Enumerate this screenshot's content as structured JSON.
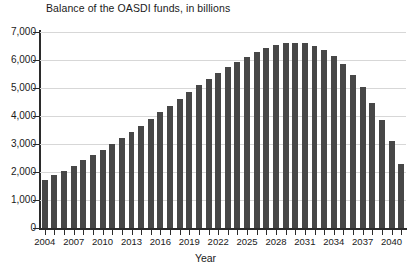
{
  "chart_data": {
    "type": "bar",
    "title": "Balance of the OASDI funds, in billions",
    "xlabel": "Year",
    "ylabel": "",
    "ylim": [
      0,
      7000
    ],
    "ytick_labels": [
      "0",
      "1,000",
      "2,000",
      "3,000",
      "4,000",
      "5,000",
      "6,000",
      "7,000"
    ],
    "ytick_values": [
      0,
      1000,
      2000,
      3000,
      4000,
      5000,
      6000,
      7000
    ],
    "grid": true,
    "legend": null,
    "xtick_labels": [
      "2004",
      "2007",
      "2010",
      "2013",
      "2016",
      "2019",
      "2022",
      "2025",
      "2028",
      "2031",
      "2034",
      "2037",
      "2040"
    ],
    "bar_color": "#474747",
    "categories": [
      "2004",
      "2005",
      "2006",
      "2007",
      "2008",
      "2009",
      "2010",
      "2011",
      "2012",
      "2013",
      "2014",
      "2015",
      "2016",
      "2017",
      "2018",
      "2019",
      "2020",
      "2021",
      "2022",
      "2023",
      "2024",
      "2025",
      "2026",
      "2027",
      "2028",
      "2029",
      "2030",
      "2031",
      "2032",
      "2033",
      "2034",
      "2035",
      "2036",
      "2037",
      "2038",
      "2039",
      "2040",
      "2041"
    ],
    "values": [
      1720,
      1880,
      2050,
      2230,
      2420,
      2610,
      2800,
      3000,
      3210,
      3430,
      3660,
      3890,
      4130,
      4370,
      4610,
      4850,
      5090,
      5320,
      5540,
      5750,
      5940,
      6120,
      6280,
      6420,
      6530,
      6600,
      6620,
      6590,
      6500,
      6350,
      6130,
      5840,
      5470,
      5020,
      4480,
      3850,
      3120,
      2290
    ]
  }
}
